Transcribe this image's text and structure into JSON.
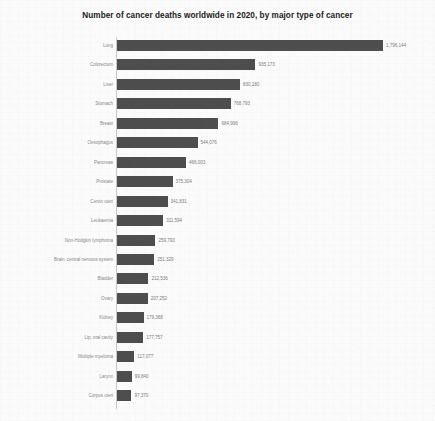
{
  "chart_data": {
    "type": "bar",
    "orientation": "horizontal",
    "title": "Number of cancer deaths worldwide in 2020, by major type of cancer",
    "xlabel": "",
    "ylabel": "",
    "xlim": [
      0,
      1796144
    ],
    "grid": false,
    "legend": null,
    "categories": [
      "Lung",
      "Colorectum",
      "Liver",
      "Stomach",
      "Breast",
      "Oesophagus",
      "Pancreas",
      "Prostate",
      "Cervix uteri",
      "Leukaemia",
      "Non-Hodgkin lymphoma",
      "Brain, central nervous system",
      "Bladder",
      "Ovary",
      "Kidney",
      "Lip, oral cavity",
      "Multiple myeloma",
      "Larynx",
      "Corpus uteri"
    ],
    "values": [
      1796144,
      935173,
      830180,
      768793,
      684996,
      544076,
      466003,
      375304,
      341831,
      311594,
      259793,
      251329,
      212536,
      207252,
      179368,
      177757,
      117077,
      99840,
      97370
    ],
    "value_labels": [
      "1,796,144",
      "935,173",
      "830,180",
      "768,793",
      "684,996",
      "544,076",
      "466,003",
      "375,304",
      "341,831",
      "311,594",
      "259,793",
      "251,329",
      "212,536",
      "207,252",
      "179,368",
      "177,757",
      "117,077",
      "99,840",
      "97,370"
    ],
    "bar_color": "#4d4d4d",
    "background_color": "#fbfbfb",
    "label_color": "#8a8a8a"
  }
}
